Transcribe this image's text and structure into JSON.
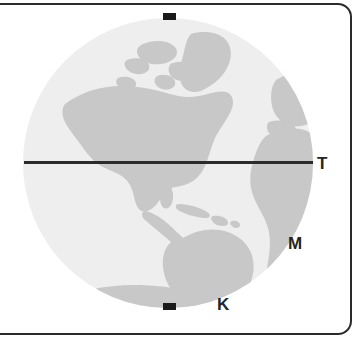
{
  "figure": {
    "type": "globe-diagram",
    "colors": {
      "ocean": "#eeeeee",
      "land": "#c8c8c8",
      "equator_line": "#2b2b2b",
      "pole_tick": "#1a1a1a",
      "frame_border": "#2b2b2b",
      "label_text": "#252525",
      "background": "#ffffff"
    }
  },
  "globe": {
    "center_x": 168,
    "center_y": 163,
    "radius": 145,
    "hemisphere_view": "Western Hemisphere",
    "landmasses": [
      "North America",
      "South America",
      "Greenland",
      "Canadian Arctic Archipelago",
      "Western Africa",
      "Western Europe",
      "Antarctica"
    ]
  },
  "equator": {
    "name": "equator-line",
    "y": 163,
    "x_start": 24,
    "x_end": 313
  },
  "poles": {
    "north_tick": {
      "x": 163,
      "y": 13,
      "width": 13,
      "height": 7
    },
    "south_tick": {
      "x": 163,
      "y": 303,
      "width": 13,
      "height": 7
    }
  },
  "labels": [
    {
      "id": "t",
      "text": "T",
      "x": 317,
      "y": 155
    },
    {
      "id": "m",
      "text": "M",
      "x": 288,
      "y": 235
    },
    {
      "id": "k",
      "text": "K",
      "x": 217,
      "y": 296
    }
  ],
  "frame": {
    "border_width": 2,
    "corner_radius": 14
  }
}
